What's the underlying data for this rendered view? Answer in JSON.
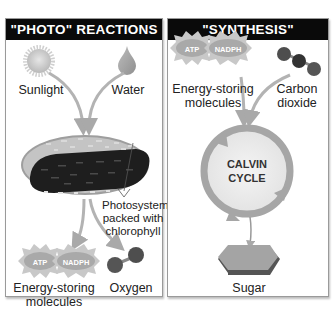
{
  "panels": {
    "photo": {
      "title": "\"PHOTO\" REACTIONS",
      "inputs": [
        {
          "label": "Sunlight",
          "icon": "sun-icon"
        },
        {
          "label": "Water",
          "icon": "water-drop-icon"
        }
      ],
      "organelle": {
        "icon": "chloroplast-icon",
        "annotation": [
          "Photosystems",
          "packed with",
          "chlorophyll"
        ]
      },
      "outputs": [
        {
          "label_lines": [
            "Energy-storing",
            "molecules"
          ],
          "badges": [
            "ATP",
            "NADPH"
          ]
        },
        {
          "label": "Oxygen",
          "icon": "oxygen-molecule-icon"
        }
      ]
    },
    "synthesis": {
      "title": "\"SYNTHESIS\" REACTIONS",
      "inputs": [
        {
          "label_lines": [
            "Energy-storing",
            "molecules"
          ],
          "badges": [
            "ATP",
            "NADPH"
          ]
        },
        {
          "label_lines": [
            "Carbon",
            "dioxide"
          ],
          "icon": "carbon-dioxide-molecule-icon"
        }
      ],
      "cycle": {
        "lines": [
          "CALVIN",
          "CYCLE"
        ]
      },
      "output": {
        "label": "Sugar",
        "icon": "sugar-hexagon-icon"
      }
    }
  },
  "colors": {
    "header_bg": "#0a0a0a",
    "header_text": "#ffffff",
    "arrow": "#a9a9a9",
    "molecule": "#555555",
    "chloroplast_inner": "#222222",
    "cycle_ring": "#a6a6a6"
  }
}
